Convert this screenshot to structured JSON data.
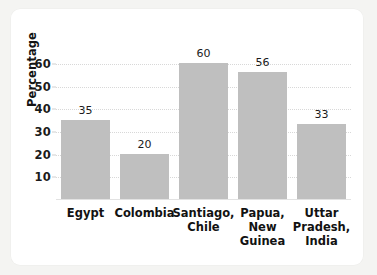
{
  "chart_data": {
    "type": "bar",
    "title": "",
    "xlabel": "",
    "ylabel": "Percentage",
    "categories": [
      "Egypt",
      "Colombia",
      "Santiago,\nChile",
      "Papua,\nNew\nGuinea",
      "Uttar\nPradesh,\nIndia"
    ],
    "values": [
      35,
      20,
      60,
      56,
      33
    ],
    "value_labels": [
      "35",
      "20",
      "60",
      "56",
      "33"
    ],
    "ylim": [
      0,
      64
    ],
    "yticks": [
      10,
      20,
      30,
      40,
      50,
      60
    ],
    "ytick_labels": [
      "10",
      "20",
      "30",
      "40",
      "50",
      "60"
    ],
    "grid": true,
    "grid_style": "dotted-horizontal",
    "legend": false,
    "bar_color": "#bfbfbf",
    "grid_color": "#d8d8d8",
    "text_color": "#1b1b1b",
    "plot_background": "#ffffff",
    "figure_background": "#f4f4f2"
  }
}
